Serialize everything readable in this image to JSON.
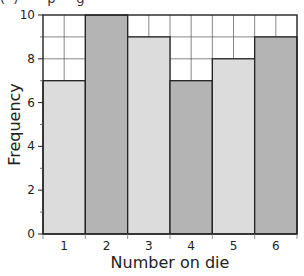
{
  "caption_fragment": "(  )       p     g",
  "chart_data": {
    "type": "bar",
    "title": "",
    "xlabel": "Number on die",
    "ylabel": "Frequency",
    "categories": [
      "1",
      "2",
      "3",
      "4",
      "5",
      "6"
    ],
    "values": [
      7,
      10,
      9,
      7,
      8,
      9
    ],
    "ylim": [
      0,
      10
    ],
    "yticks": [
      0,
      2,
      4,
      6,
      8,
      10
    ],
    "grid": true,
    "legend": "none",
    "bar_colors": [
      "#dcdcdc",
      "#b4b4b4",
      "#dcdcdc",
      "#b4b4b4",
      "#dcdcdc",
      "#b4b4b4"
    ]
  }
}
